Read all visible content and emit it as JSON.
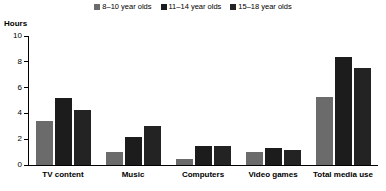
{
  "axis_title": "Hours",
  "legend": {
    "items": [
      {
        "label": "8–10 year olds",
        "color": "#6b6b6b"
      },
      {
        "label": "11–14 year olds",
        "color": "#1c1c1c"
      },
      {
        "label": "15–18 year olds",
        "color": "#232323"
      }
    ]
  },
  "chart_data": {
    "type": "bar",
    "title": "",
    "subtitle": "",
    "xlabel": "",
    "ylabel": "Hours",
    "ylim": [
      0,
      10
    ],
    "yticks": [
      0,
      2,
      4,
      6,
      8,
      10
    ],
    "ytick_labels": [
      "0",
      "2",
      "4",
      "6",
      "8",
      "10"
    ],
    "grid": false,
    "legend_position": "top-center",
    "categories": [
      "TV content",
      "Music",
      "Computers",
      "Video games",
      "Total media use"
    ],
    "series": [
      {
        "name": "8–10 year olds",
        "color": "#6b6b6b",
        "values": [
          3.4,
          1.0,
          0.5,
          1.0,
          5.3
        ]
      },
      {
        "name": "11–14 year olds",
        "color": "#1c1c1c",
        "values": [
          5.2,
          2.2,
          1.5,
          1.3,
          8.4
        ]
      },
      {
        "name": "15–18 year olds",
        "color": "#232323",
        "values": [
          4.3,
          3.0,
          1.5,
          1.2,
          7.5
        ]
      }
    ]
  }
}
